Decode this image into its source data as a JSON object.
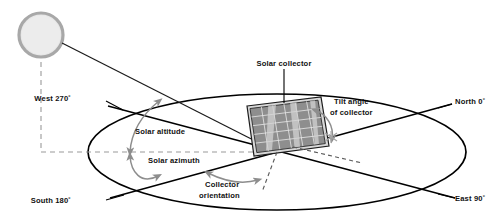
{
  "figure": {
    "background_color": "#ffffff"
  },
  "colors": {
    "line": "#000000",
    "arc_arrow": "#8d8d8d",
    "dashed": "#9a9a9a",
    "sun_fill": "#e6e6e6",
    "sun_ring": "#a8a8a8",
    "panel_face": "#8e8e8e",
    "panel_frame": "#d8d8d8",
    "text": "#111111"
  },
  "labels": {
    "solar_collector": "Solar collector",
    "tilt_angle_line1": "Tilt angle",
    "tilt_angle_line2": "of collector",
    "solar_altitude": "Solar altitude",
    "solar_azimuth": "Solar azimuth",
    "collector_orientation_line1": "Collector",
    "collector_orientation_line2": "orientation"
  },
  "compass": {
    "west": "West 270˚",
    "north": "North 0˚",
    "south": "South 180˚",
    "east": "East 90˚"
  },
  "elements": {
    "sun_name": "sun",
    "horizon_name": "horizon-ellipse",
    "panel_name": "solar-collector-panel",
    "sun_ray_name": "sun-ray-line"
  }
}
